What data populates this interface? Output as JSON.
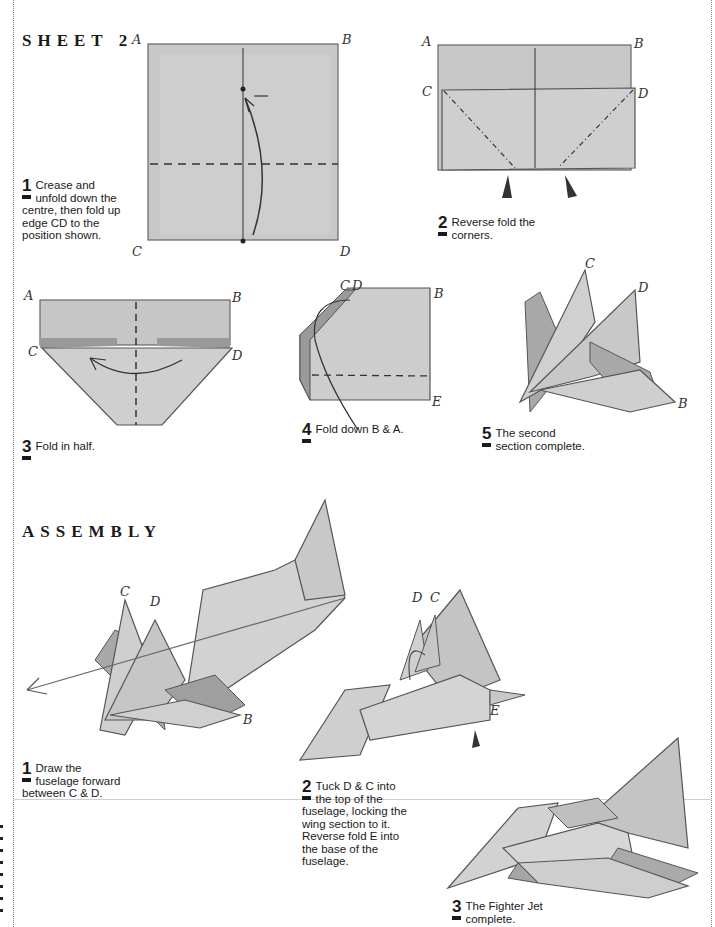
{
  "sheet": {
    "title": "SHEET 2",
    "steps": [
      {
        "num": "1",
        "lines": [
          "Crease and",
          "unfold down the",
          "centre, then fold up",
          "edge CD to the",
          "position shown."
        ]
      },
      {
        "num": "2",
        "lines": [
          "Reverse fold the",
          "corners."
        ]
      },
      {
        "num": "3",
        "lines": [
          "Fold in half."
        ]
      },
      {
        "num": "4",
        "lines": [
          "Fold down B & A."
        ]
      },
      {
        "num": "5",
        "lines": [
          "The second",
          "section complete."
        ]
      }
    ],
    "figure_labels": {
      "fig1": [
        "A",
        "B",
        "C",
        "D"
      ],
      "fig2": [
        "A",
        "B",
        "C",
        "D"
      ],
      "fig3": [
        "A",
        "B",
        "C",
        "D"
      ],
      "fig4": [
        "C",
        "D",
        "B",
        "E"
      ],
      "fig5": [
        "C",
        "D",
        "B"
      ]
    }
  },
  "assembly": {
    "title": "ASSEMBLY",
    "steps": [
      {
        "num": "1",
        "lines": [
          "Draw the",
          "fuselage forward",
          "between C & D."
        ]
      },
      {
        "num": "2",
        "lines": [
          "Tuck D & C into",
          "the top of the",
          "fuselage, locking the",
          "wing section to it.",
          "Reverse fold E into",
          "the base of the",
          "fuselage."
        ]
      },
      {
        "num": "3",
        "lines": [
          "The Fighter Jet",
          "complete."
        ]
      }
    ],
    "figure_labels": {
      "fig1": [
        "C",
        "D",
        "B"
      ],
      "fig2": [
        "D",
        "C",
        "E"
      ]
    }
  },
  "colors": {
    "paper_fill": "#c9c9c9",
    "paper_light": "#dcdcdc",
    "paper_dark": "#a8a8a8",
    "line": "#555555",
    "text": "#1a1a1a"
  }
}
